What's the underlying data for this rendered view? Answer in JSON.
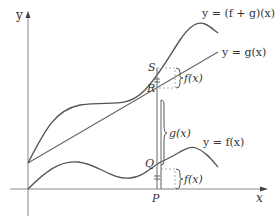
{
  "diagram": {
    "axes": {
      "x_label": "x",
      "y_label": "y"
    },
    "curves": [
      {
        "id": "f_plus_g",
        "label": "y = (f + g)(x)"
      },
      {
        "id": "g",
        "label": "y = g(x)"
      },
      {
        "id": "f",
        "label": "y = f(x)"
      }
    ],
    "points": {
      "S": "S",
      "R": "R",
      "Q": "Q",
      "P": "P"
    },
    "braces": {
      "upper_f": "f(x)",
      "g": "g(x)",
      "lower_f": "f(x)"
    },
    "colors": {
      "curve": "#555555",
      "axis": "#777777",
      "text": "#333333",
      "dash": "#999999"
    }
  }
}
